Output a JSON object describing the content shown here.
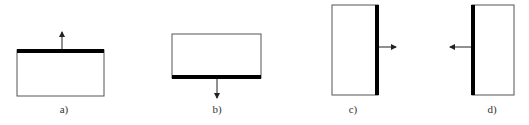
{
  "figure": {
    "colors": {
      "outline": "#555555",
      "thick_edge": "#000000",
      "arrow": "#222222",
      "background": "#ffffff"
    },
    "panels": [
      {
        "id": "a",
        "label": "a)",
        "thick_edge": "top",
        "arrow_direction": "up",
        "rect": {
          "x": 17,
          "y": 50,
          "w": 87,
          "h": 46
        },
        "label_pos": {
          "x": 64,
          "y": 113
        }
      },
      {
        "id": "b",
        "label": "b)",
        "thick_edge": "bottom",
        "arrow_direction": "down",
        "rect": {
          "x": 172,
          "y": 34,
          "w": 89,
          "h": 44
        },
        "label_pos": {
          "x": 217,
          "y": 113
        }
      },
      {
        "id": "c",
        "label": "c)",
        "thick_edge": "right",
        "arrow_direction": "right",
        "rect": {
          "x": 332,
          "y": 5,
          "w": 46,
          "h": 90
        },
        "label_pos": {
          "x": 353,
          "y": 113
        }
      },
      {
        "id": "d",
        "label": "d)",
        "thick_edge": "left",
        "arrow_direction": "left",
        "rect": {
          "x": 472,
          "y": 5,
          "w": 42,
          "h": 90
        },
        "label_pos": {
          "x": 492,
          "y": 113
        }
      }
    ]
  }
}
